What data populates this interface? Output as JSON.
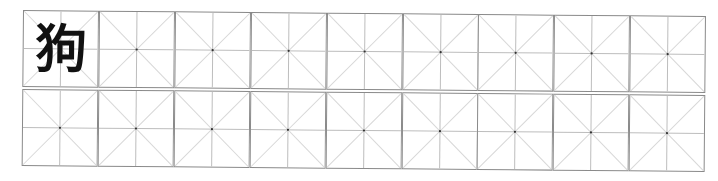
{
  "worksheet": {
    "type": "mi-zi-ge practice grid",
    "rows": 2,
    "columns": 9,
    "cells": [
      [
        "狗",
        "",
        "",
        "",
        "",
        "",
        "",
        "",
        ""
      ],
      [
        "",
        "",
        "",
        "",
        "",
        "",
        "",
        "",
        ""
      ]
    ]
  },
  "colors": {
    "border": "#8a8a8a",
    "guide_line": "#bdbdbd",
    "diagonal_line": "#d8d8d8",
    "center_dot": "#333333",
    "character": "#111111"
  }
}
